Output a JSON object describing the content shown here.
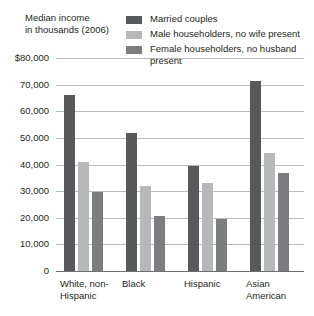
{
  "chart_data": {
    "type": "bar",
    "title": "Median income in thousands (2006)",
    "title_lines": [
      "Median income",
      "in thousands (2006)"
    ],
    "xlabel": "",
    "ylabel": "Median income in thousands (2006)",
    "ylim": [
      0,
      80000
    ],
    "ytick_values": [
      80000,
      70000,
      60000,
      50000,
      40000,
      30000,
      20000,
      10000,
      0
    ],
    "ytick_labels": [
      "$80,000",
      "70,000",
      "60,000",
      "50,000",
      "40,000",
      "30,000",
      "20,000",
      "10,000",
      "0"
    ],
    "grid": true,
    "legend_position": "top-right",
    "categories": [
      "White, non-Hispanic",
      "Black",
      "Hispanic",
      "Asian American"
    ],
    "category_label_lines": [
      [
        "White, non-",
        "Hispanic"
      ],
      [
        "Black"
      ],
      [
        "Hispanic"
      ],
      [
        "Asian",
        "American"
      ]
    ],
    "series": [
      {
        "name": "Married couples",
        "label_lines": [
          "Married couples"
        ],
        "color": "#58595b",
        "values": [
          66000,
          52000,
          39500,
          71500
        ]
      },
      {
        "name": "Male householders, no wife present",
        "label_lines": [
          "Male householders,",
          "no wife present"
        ],
        "color": "#b6b8ba",
        "values": [
          41000,
          32000,
          33000,
          44500
        ]
      },
      {
        "name": "Female householders, no husband present",
        "label_lines": [
          "Female householders,",
          "no husband present"
        ],
        "color": "#7b7d7f",
        "values": [
          29500,
          20500,
          19500,
          37000
        ]
      }
    ]
  },
  "colors": {
    "gridline": "#b9bcbe",
    "axis": "#6d6f71",
    "text": "#231f20",
    "background": "#ffffff"
  }
}
